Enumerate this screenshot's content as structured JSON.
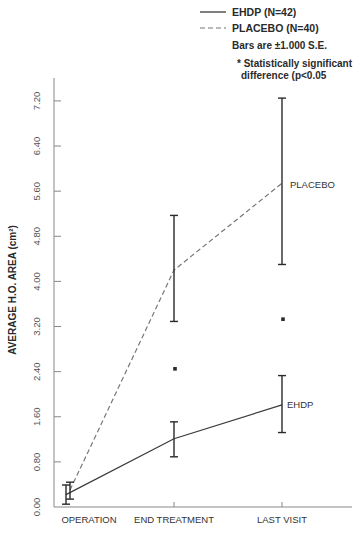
{
  "chart_data": {
    "type": "line",
    "title": "",
    "xlabel": "",
    "ylabel": "AVERAGE H.O. AREA (cm²)",
    "categories": [
      "OPERATION",
      "END TREATMENT",
      "LAST VISIT"
    ],
    "y_ticks": [
      "0.00",
      "0.80",
      "1.60",
      "2.40",
      "3.20",
      "4.00",
      "4.80",
      "5.60",
      "6.40",
      "7.20"
    ],
    "y_tick_values": [
      0.0,
      0.8,
      1.6,
      2.4,
      3.2,
      4.0,
      4.8,
      5.6,
      6.4,
      7.2
    ],
    "ylim": [
      0,
      7.6
    ],
    "grid": false,
    "legend_position": "top-right",
    "series": [
      {
        "name": "EHDP (N=42)",
        "short_label": "EHDP",
        "line_style": "solid",
        "values": [
          0.22,
          1.21,
          1.81
        ],
        "error_low": [
          0.05,
          0.89,
          1.32
        ],
        "error_high": [
          0.39,
          1.51,
          2.33
        ]
      },
      {
        "name": "PLACEBO (N=40)",
        "short_label": "PLACEBO",
        "line_style": "dashed",
        "values": [
          0.3,
          4.2,
          5.74
        ],
        "error_low": [
          0.14,
          3.29,
          4.3
        ],
        "error_high": [
          0.44,
          5.17,
          7.25
        ]
      }
    ],
    "annotations": [
      {
        "category": "END TREATMENT",
        "y": 2.45,
        "text": "*"
      },
      {
        "category": "LAST VISIT",
        "y": 3.33,
        "text": "*"
      }
    ],
    "legend_notes": [
      "Bars are ±1.000 S.E.",
      "* Statistically significant",
      "difference (p<0.05"
    ]
  },
  "legend": {
    "ehdp": "EHDP  (N=42)",
    "placebo": "PLACEBO  (N=40)",
    "bars_note": "Bars are ±1.000 S.E.",
    "sig_line1": "* Statistically significant",
    "sig_line2": "difference (p<0.05"
  },
  "colors": {
    "ink": "#2a2a2a",
    "axis": "#777777",
    "tick_label": "#555555",
    "dashed": "#777777"
  }
}
